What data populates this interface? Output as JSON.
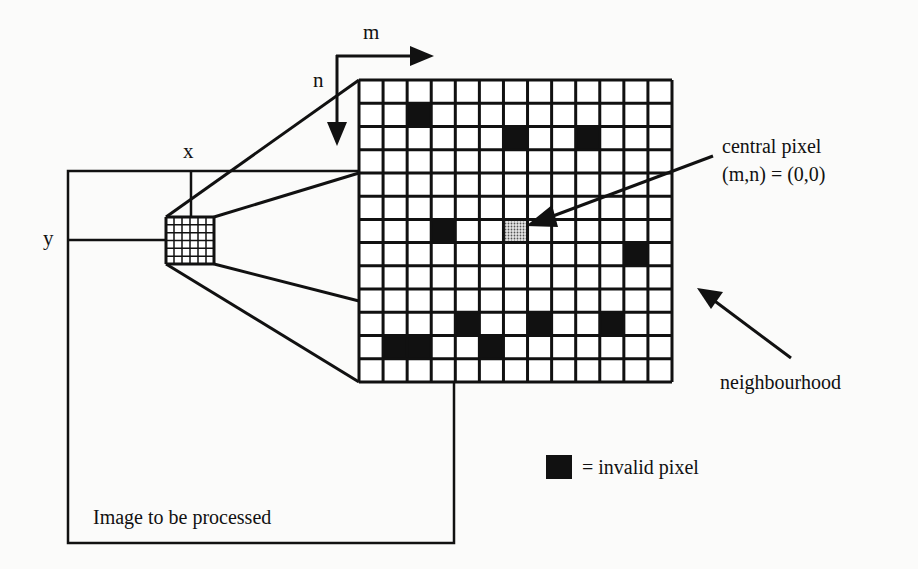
{
  "diagram": {
    "type": "neighbourhood-processing-illustration",
    "labels": {
      "m_axis": "m",
      "n_axis": "n",
      "x_axis": "x",
      "y_axis": "y",
      "central_pixel_line1": "central pixel",
      "central_pixel_line2": "(m,n) = (0,0)",
      "neighbourhood": "neighbourhood",
      "legend_text": "= invalid pixel",
      "image_label": "Image to be processed"
    },
    "neighbourhood_grid": {
      "cols": 13,
      "rows": 13,
      "central_pixel": {
        "row": 6,
        "col": 6
      },
      "invalid_pixels": [
        {
          "row": 1,
          "col": 2
        },
        {
          "row": 2,
          "col": 6
        },
        {
          "row": 2,
          "col": 9
        },
        {
          "row": 6,
          "col": 3
        },
        {
          "row": 7,
          "col": 11
        },
        {
          "row": 10,
          "col": 4
        },
        {
          "row": 10,
          "col": 7
        },
        {
          "row": 10,
          "col": 10
        },
        {
          "row": 11,
          "col": 1
        },
        {
          "row": 11,
          "col": 2
        },
        {
          "row": 11,
          "col": 5
        }
      ]
    },
    "small_window_grid": {
      "cols": 6,
      "rows": 6
    },
    "colors": {
      "line": "#111111",
      "invalid": "#111111",
      "central_fill": "#bdbdbd",
      "background": "#fbfbfa"
    }
  }
}
